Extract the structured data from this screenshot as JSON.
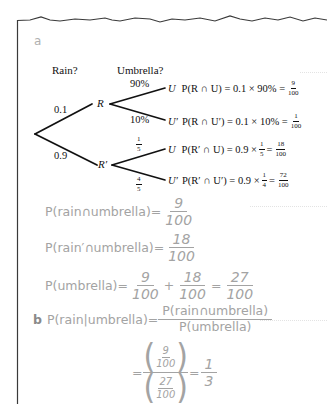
{
  "part_a": {
    "label": "a",
    "headers": {
      "rain": "Rain?",
      "umbrella": "Umbrella?"
    },
    "tree": {
      "first_branches": [
        {
          "prob": "0.1",
          "node": "R"
        },
        {
          "prob": "0.9",
          "node": "R′"
        }
      ],
      "second_branches": [
        {
          "parent": "R",
          "prob": "90%",
          "node": "U",
          "eq_lhs": "P(R ∩ U) = 0.1 × 90% =",
          "eq_num": "9",
          "eq_den": "100"
        },
        {
          "parent": "R",
          "prob": "10%",
          "node": "U′",
          "eq_lhs": "P(R ∩ U′) = 0.1 × 10% =",
          "eq_num": "1",
          "eq_den": "100"
        },
        {
          "parent": "R′",
          "prob_num": "1",
          "prob_den": "5",
          "node": "U",
          "eq_lhs": "P(R′ ∩ U) = 0.9 ×",
          "eq_frac_num": "1",
          "eq_frac_den": "5",
          "eq_num": "18",
          "eq_den": "100"
        },
        {
          "parent": "R′",
          "prob_num": "4",
          "prob_den": "5",
          "node": "U′",
          "eq_lhs": "P(R′ ∩ U′) = 0.9 ×",
          "eq_frac_num": "1",
          "eq_frac_den": "4",
          "eq_num": "72",
          "eq_den": "100"
        }
      ]
    },
    "equations": [
      {
        "lhs": "P(rain∩umbrella)=",
        "num": "9",
        "den": "100"
      },
      {
        "lhs": "P(rain′∩umbrella)=",
        "num": "18",
        "den": "100"
      },
      {
        "lhs": "P(umbrella)=",
        "terms": [
          {
            "num": "9",
            "den": "100"
          },
          {
            "num": "18",
            "den": "100"
          }
        ],
        "plus": "+",
        "equals": "=",
        "result": {
          "num": "27",
          "den": "100"
        }
      }
    ]
  },
  "part_b": {
    "label": "b",
    "lhs": "P(rain|umbrella)=",
    "num": "P(rain∩umbrella)",
    "den": "P(umbrella)",
    "step2": {
      "equals": "=",
      "inner_num": {
        "num": "9",
        "den": "100"
      },
      "inner_den": {
        "num": "27",
        "den": "100"
      },
      "equals2": "=",
      "result": {
        "num": "1",
        "den": "3"
      }
    }
  }
}
